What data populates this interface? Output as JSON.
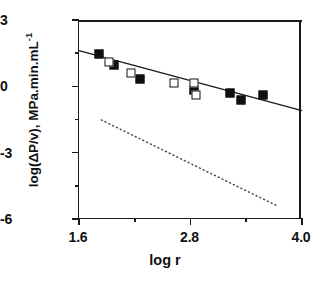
{
  "chart_data": {
    "type": "scatter",
    "title": "",
    "xlabel": "log  r",
    "ylabel": "log(ΔP/v),  MPa.min.mL",
    "ylabel_exponent": "-1",
    "xlim": [
      1.6,
      4.0
    ],
    "ylim": [
      -6,
      3
    ],
    "x_ticks": [
      1.6,
      2.8,
      4.0
    ],
    "x_tick_labels": [
      "1.6",
      "2.8",
      "4.0"
    ],
    "x_minor_ticks": [
      2.2,
      3.4
    ],
    "y_ticks": [
      3,
      0,
      -3,
      -6
    ],
    "y_tick_labels": [
      "3",
      "0",
      "-3",
      "-6"
    ],
    "y_minor_ticks": [
      1.5,
      -1.5,
      -4.5
    ],
    "grid": false,
    "legend": "none",
    "series": [
      {
        "name": "filled-squares",
        "marker": "filled-square",
        "color": "#101010",
        "points": [
          [
            1.82,
            1.45
          ],
          [
            1.98,
            0.95
          ],
          [
            2.26,
            0.32
          ],
          [
            2.84,
            -0.18
          ],
          [
            3.22,
            -0.29
          ],
          [
            3.34,
            -0.6
          ],
          [
            3.58,
            -0.38
          ]
        ]
      },
      {
        "name": "open-squares",
        "marker": "open-square",
        "color": "#101010",
        "points": [
          [
            1.92,
            1.1
          ],
          [
            2.16,
            0.62
          ],
          [
            2.62,
            0.14
          ],
          [
            2.84,
            0.16
          ],
          [
            2.86,
            -0.38
          ]
        ]
      }
    ],
    "lines": [
      {
        "name": "regression-line",
        "style": "solid",
        "color": "#1a1a1a",
        "from": [
          1.6,
          1.62
        ],
        "to": [
          4.0,
          -1.1
        ]
      },
      {
        "name": "reference-line",
        "style": "dotted",
        "color": "#4a4a4a",
        "from": [
          1.84,
          -1.52
        ],
        "to": [
          3.72,
          -5.38
        ]
      }
    ]
  }
}
